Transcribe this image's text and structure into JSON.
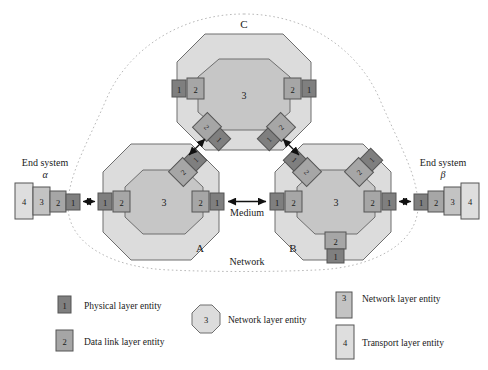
{
  "figure": {
    "title_letters": {
      "node_a": "A",
      "node_b": "B",
      "node_c": "C"
    },
    "network_label": "Network",
    "medium_label": "Medium",
    "end_systems": {
      "left": {
        "title": "End system",
        "greek": "α",
        "stack": [
          "4",
          "3",
          "2",
          "1"
        ]
      },
      "right": {
        "title": "End system",
        "greek": "β",
        "stack": [
          "1",
          "2",
          "3",
          "4"
        ]
      }
    },
    "nodes": {
      "a": {
        "letter": "A",
        "center_entity": "3",
        "ports": [
          {
            "name": "left",
            "outer": "1",
            "inner": "2"
          },
          {
            "name": "right",
            "inner": "2",
            "outer": "1"
          },
          {
            "name": "upper-right-diagonal",
            "inner": "2",
            "outer": "1"
          }
        ]
      },
      "b": {
        "letter": "B",
        "center_entity": "3",
        "ports": [
          {
            "name": "left",
            "outer": "1",
            "inner": "2"
          },
          {
            "name": "right",
            "inner": "2",
            "outer": "1"
          },
          {
            "name": "upper-left-diagonal",
            "inner": "2",
            "outer": "1"
          },
          {
            "name": "upper-right-diagonal",
            "inner": "2",
            "outer": "1"
          },
          {
            "name": "bottom",
            "inner": "2",
            "outer": "1"
          }
        ]
      },
      "c": {
        "letter": "C",
        "center_entity": "3",
        "ports": [
          {
            "name": "left",
            "outer": "1",
            "inner": "2"
          },
          {
            "name": "right",
            "inner": "2",
            "outer": "1"
          },
          {
            "name": "lower-left-diagonal",
            "inner": "2",
            "outer": "1"
          },
          {
            "name": "lower-right-diagonal",
            "inner": "2",
            "outer": "1"
          }
        ]
      }
    },
    "legend": {
      "items": [
        {
          "key": "physical",
          "symbol": "1",
          "shape": "box-small-dark",
          "label": "Physical layer entity"
        },
        {
          "key": "datalink",
          "symbol": "2",
          "shape": "box-small-mid",
          "label": "Data link layer entity"
        },
        {
          "key": "network-octagon",
          "symbol": "3",
          "shape": "octagon",
          "label": "Network layer entity"
        },
        {
          "key": "network-box",
          "symbol": "3",
          "shape": "box-tall-mid",
          "label": "Network layer entity"
        },
        {
          "key": "transport",
          "symbol": "4",
          "shape": "box-tall-light",
          "label": "Transport layer entity"
        }
      ]
    },
    "colors": {
      "physical": "#7f7f7f",
      "datalink": "#a6a6a6",
      "network_box": "#c3c3c3",
      "transport": "#dedede",
      "octagon_outer": "#dcdcdc",
      "octagon_inner": "#c6c6c6",
      "stroke": "#555555",
      "dotted_boundary": "#b9b9b9",
      "arrow": "#111111",
      "background": "#ffffff"
    }
  }
}
